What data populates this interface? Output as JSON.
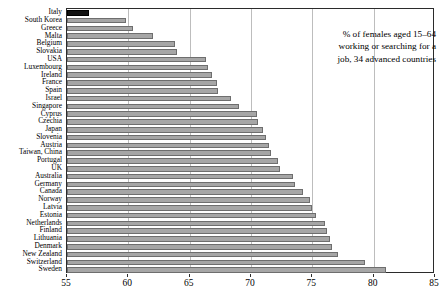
{
  "annotation": {
    "line1": "% of females aged 15–64",
    "line2": "working or searching for a",
    "line3": "job, 34 advanced countries"
  },
  "axis": {
    "ticks": [
      "55",
      "60",
      "65",
      "70",
      "75",
      "80",
      "85"
    ]
  },
  "chart_data": {
    "type": "bar",
    "orientation": "horizontal",
    "title": "",
    "subtitle": "",
    "xlabel": "",
    "ylabel": "",
    "xlim": [
      55,
      85
    ],
    "xticks": [
      55,
      60,
      65,
      70,
      75,
      80,
      85
    ],
    "grid": true,
    "legend": false,
    "annotation": "% of females aged 15–64 working or searching for a job, 34 advanced countries",
    "highlight_category": "Italy",
    "highlight_color": "#111111",
    "bar_color": "#a6a6a6",
    "categories": [
      "Italy",
      "South Korea",
      "Greece",
      "Malta",
      "Belgium",
      "Slovakia",
      "USA",
      "Luxembourg",
      "Ireland",
      "France",
      "Spain",
      "Israel",
      "Singapore",
      "Cyprus",
      "Czechia",
      "Japan",
      "Slovenia",
      "Austria",
      "Taiwan, China",
      "Portugal",
      "UK",
      "Australia",
      "Germany",
      "Canada",
      "Norway",
      "Latvia",
      "Estonia",
      "Netherlands",
      "Finland",
      "Lithuania",
      "Denmark",
      "New Zealand",
      "Switzerland",
      "Sweden"
    ],
    "values": [
      56.8,
      59.8,
      60.4,
      62.0,
      63.8,
      64.0,
      66.3,
      66.5,
      66.8,
      67.2,
      67.3,
      68.4,
      69.0,
      70.5,
      70.6,
      71.0,
      71.2,
      71.5,
      71.6,
      72.2,
      72.4,
      73.4,
      73.6,
      74.2,
      74.8,
      75.0,
      75.3,
      76.0,
      76.2,
      76.4,
      76.6,
      77.1,
      79.3,
      81.0
    ],
    "value_unit": "%"
  }
}
